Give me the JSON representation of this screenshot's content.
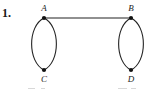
{
  "figure": {
    "problem_number": "1.",
    "background_color": "#ffffff",
    "ink_color": "#222222",
    "canvas": {
      "width": 157,
      "height": 91
    },
    "vertices": [
      {
        "id": "A",
        "label": "A",
        "x": 44,
        "y": 18,
        "label_x": 44,
        "label_y": 11,
        "label_position": "above"
      },
      {
        "id": "B",
        "label": "B",
        "x": 131,
        "y": 18,
        "label_x": 131,
        "label_y": 11,
        "label_position": "above"
      },
      {
        "id": "C",
        "label": "C",
        "x": 44,
        "y": 70,
        "label_x": 44,
        "label_y": 82,
        "label_position": "below"
      },
      {
        "id": "D",
        "label": "D",
        "x": 131,
        "y": 70,
        "label_x": 131,
        "label_y": 82,
        "label_position": "below"
      }
    ],
    "edges": [
      {
        "id": "AB",
        "from": "A",
        "to": "B",
        "kind": "straight"
      },
      {
        "id": "AC-left",
        "from": "A",
        "to": "C",
        "kind": "arc",
        "bulge": "left"
      },
      {
        "id": "AC-right",
        "from": "A",
        "to": "C",
        "kind": "arc",
        "bulge": "right"
      },
      {
        "id": "BD-left",
        "from": "B",
        "to": "D",
        "kind": "arc",
        "bulge": "left"
      },
      {
        "id": "BD-right",
        "from": "B",
        "to": "D",
        "kind": "arc",
        "bulge": "right"
      }
    ],
    "arc_half_width": 16.5,
    "vertex_dot_radius": 2.1
  }
}
